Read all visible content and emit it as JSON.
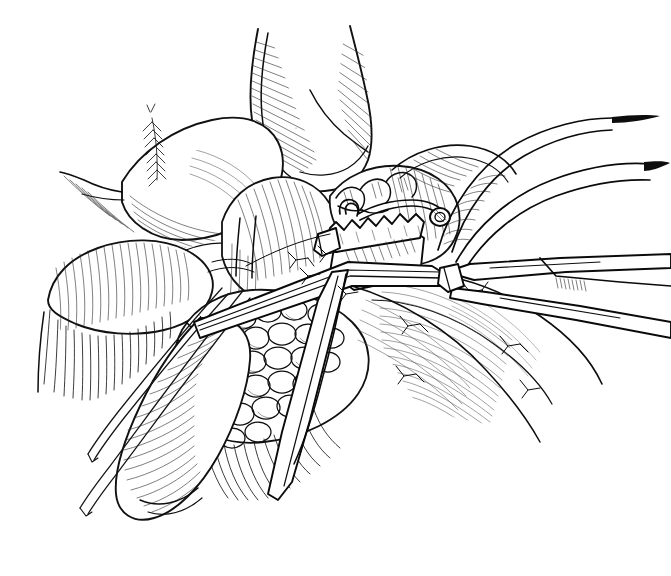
{
  "figure": {
    "medium": "pen-and-ink line drawing",
    "canvas": {
      "width": 671,
      "height": 576
    },
    "background_color": "#ffffff",
    "ink_color": "#0d0d0d",
    "has_visible_text": false,
    "has_caption": false,
    "has_labels": false,
    "has_signature": false
  },
  "palette": {
    "paper": "#ffffff",
    "ink_dark": "#0d0d0d",
    "ink_mid": "#1a1a1a",
    "ink_light": "#555555"
  },
  "regions": [
    {
      "id": "upper-duct",
      "name": "upper tubular duct",
      "description": "Vertical tubular structure entering from top center, folded flap with dense parallel hatching",
      "bbox": [
        245,
        25,
        175,
        160
      ]
    },
    {
      "id": "left-organ-upper",
      "name": "upper left organ lobe",
      "description": "Smooth rounded lobe, stippled highlight, hatched lower margin",
      "bbox": [
        120,
        110,
        180,
        130
      ]
    },
    {
      "id": "left-organ-lower",
      "name": "lower left organ lobe",
      "description": "Elongated lobe with long vertical hatching fringe along underside",
      "bbox": [
        45,
        215,
        175,
        140
      ]
    },
    {
      "id": "pancreas-body",
      "name": "lobulated pancreatic tissue",
      "description": "Cluster of rounded lobules with branching surface vessels",
      "bbox": [
        175,
        290,
        200,
        200
      ]
    },
    {
      "id": "duodenum",
      "name": "duodenal loop",
      "description": "Smooth tubular loop running diagonally lower left with transverse hatching",
      "bbox": [
        95,
        330,
        170,
        200
      ]
    },
    {
      "id": "clamp-jaw",
      "name": "serrated clamp jaw",
      "description": "Rectangular instrument jaw with saw-tooth serrated edge and curved hook handle",
      "bbox": [
        315,
        195,
        135,
        95
      ]
    },
    {
      "id": "forceps-shafts",
      "name": "forceps shafts",
      "description": "Two long tapering instrument shafts exiting the right edge of the field",
      "bbox": [
        440,
        230,
        231,
        90
      ]
    },
    {
      "id": "retractor-bands",
      "name": "curved retractor bands",
      "description": "Two long curved tissue bands / retractor blades sweeping from upper right",
      "bbox": [
        420,
        110,
        230,
        140
      ]
    },
    {
      "id": "probe-wires",
      "name": "probe wires",
      "description": "Pair of fine straight wires running to lower left corner",
      "bbox": [
        60,
        290,
        200,
        250
      ]
    },
    {
      "id": "right-mesentery",
      "name": "right mesenteric sheet",
      "description": "Broad shaded sheet with fine curved hatching and branching vessels",
      "bbox": [
        370,
        250,
        240,
        200
      ]
    }
  ],
  "chart_data": null
}
